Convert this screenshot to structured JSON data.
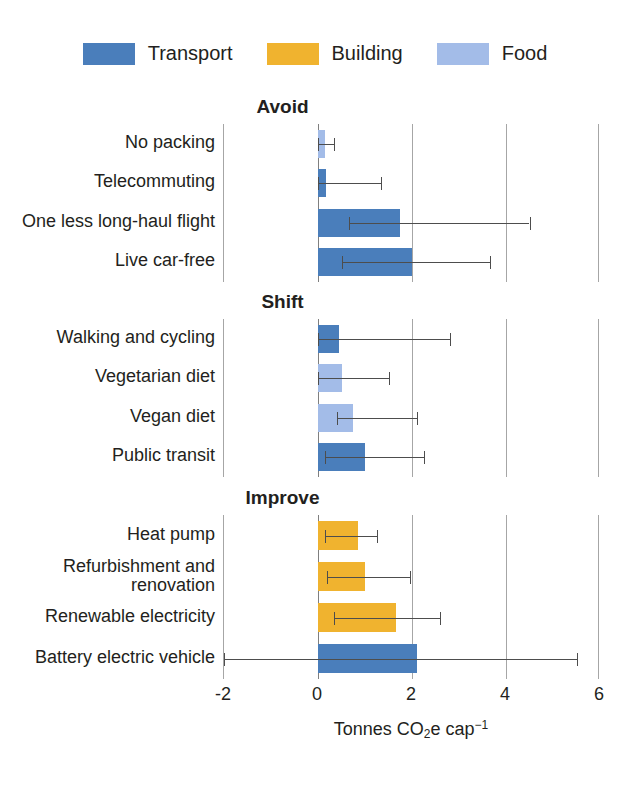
{
  "legend": {
    "items": [
      {
        "label": "Transport",
        "color": "#4a7ebb",
        "swatch_name": "legend-swatch-transport"
      },
      {
        "label": "Building",
        "color": "#f0b32f",
        "swatch_name": "legend-swatch-building"
      },
      {
        "label": "Food",
        "color": "#a3bce8",
        "swatch_name": "legend-swatch-food"
      }
    ]
  },
  "axis": {
    "title_main": "Tonnes CO",
    "title_sub": "2",
    "title_mid": "e cap",
    "title_sup": "−1",
    "ticks": [
      "-2",
      "0",
      "2",
      "4",
      "6"
    ],
    "min": -2,
    "max": 6
  },
  "panels": [
    {
      "title": "Avoid"
    },
    {
      "title": "Shift"
    },
    {
      "title": "Improve"
    }
  ],
  "chart_data": {
    "type": "bar",
    "orientation": "horizontal",
    "title": "",
    "xlabel": "Tonnes CO2e cap−1",
    "ylabel": "",
    "xlim": [
      -2,
      6
    ],
    "xticks": [
      -2,
      0,
      2,
      4,
      6
    ],
    "grid": "vertical gridlines at -2, 2, 4, 6; darker zero line at 0",
    "legend": {
      "position": "top-center",
      "entries": [
        {
          "name": "Transport",
          "color": "#4a7ebb"
        },
        {
          "name": "Building",
          "color": "#f0b32f"
        },
        {
          "name": "Food",
          "color": "#a3bce8"
        }
      ]
    },
    "panels": [
      {
        "name": "Avoid",
        "items": [
          {
            "category": "No packing",
            "value": 0.14,
            "err_low": 0.0,
            "err_high": 0.33,
            "series": "Food"
          },
          {
            "category": "Telecommuting",
            "value": 0.18,
            "err_low": 0.0,
            "err_high": 1.35,
            "series": "Transport"
          },
          {
            "category": "One less long-haul flight",
            "value": 1.75,
            "err_low": 0.65,
            "err_high": 4.5,
            "series": "Transport"
          },
          {
            "category": "Live car-free",
            "value": 2.0,
            "err_low": 0.5,
            "err_high": 3.65,
            "series": "Transport"
          }
        ]
      },
      {
        "name": "Shift",
        "items": [
          {
            "category": "Walking and cycling",
            "value": 0.45,
            "err_low": 0.0,
            "err_high": 2.8,
            "series": "Transport"
          },
          {
            "category": "Vegetarian diet",
            "value": 0.5,
            "err_low": 0.0,
            "err_high": 1.5,
            "series": "Food"
          },
          {
            "category": "Vegan diet",
            "value": 0.75,
            "err_low": 0.4,
            "err_high": 2.1,
            "series": "Food"
          },
          {
            "category": "Public transit",
            "value": 1.0,
            "err_low": 0.15,
            "err_high": 2.25,
            "series": "Transport"
          }
        ]
      },
      {
        "name": "Improve",
        "items": [
          {
            "category": "Heat pump",
            "value": 0.85,
            "err_low": 0.15,
            "err_high": 1.25,
            "series": "Building"
          },
          {
            "category": "Refurbishment and renovation",
            "value": 1.0,
            "err_low": 0.2,
            "err_high": 1.95,
            "series": "Building"
          },
          {
            "category": "Renewable electricity",
            "value": 1.65,
            "err_low": 0.35,
            "err_high": 2.6,
            "series": "Building"
          },
          {
            "category": "Battery electric vehicle",
            "value": 2.1,
            "err_low": -2.0,
            "err_high": 5.5,
            "series": "Transport"
          }
        ]
      }
    ]
  }
}
